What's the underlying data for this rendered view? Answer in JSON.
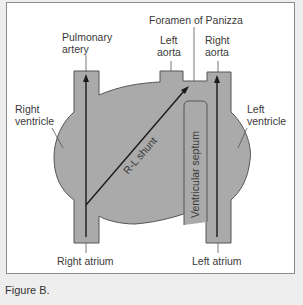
{
  "figure": {
    "caption": "Figure B.",
    "colors": {
      "heart_fill": "#aaaaaa",
      "outline": "#555555",
      "arrow": "#1a1a1a",
      "text": "#3a3a3a",
      "frame_border": "#8a8a8a",
      "page_bg": "#eeeeee"
    }
  },
  "labels": {
    "pulmonary_artery_line1": "Pulmonary",
    "pulmonary_artery_line2": "artery",
    "foramen": "Foramen of Panizza",
    "left_aorta_line1": "Left",
    "left_aorta_line2": "aorta",
    "right_aorta_line1": "Right",
    "right_aorta_line2": "aorta",
    "right_ventricle_line1": "Right",
    "right_ventricle_line2": "ventricle",
    "left_ventricle_line1": "Left",
    "left_ventricle_line2": "ventricle",
    "shunt": "R-L shunt",
    "septum": "Ventricular septum",
    "right_atrium": "Right atrium",
    "left_atrium": "Left atrium"
  }
}
